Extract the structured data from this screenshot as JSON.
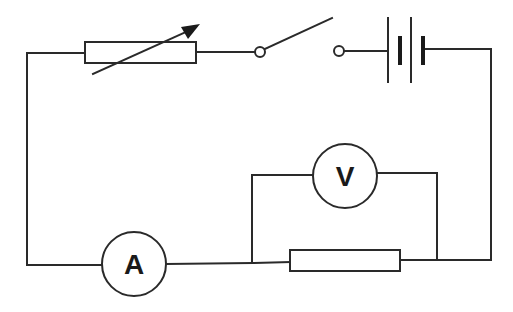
{
  "diagram": {
    "type": "electrical-circuit",
    "colors": {
      "line": "#2a2a2a",
      "background": "#ffffff"
    },
    "components": {
      "variable_resistor": {
        "label": "variable-resistor"
      },
      "switch": {
        "label": "switch",
        "state": "open"
      },
      "battery": {
        "label": "battery",
        "cells": 2
      },
      "voltmeter": {
        "label": "voltmeter",
        "symbol": "V"
      },
      "ammeter": {
        "label": "ammeter",
        "symbol": "A"
      },
      "resistor": {
        "label": "fixed-resistor"
      }
    }
  }
}
